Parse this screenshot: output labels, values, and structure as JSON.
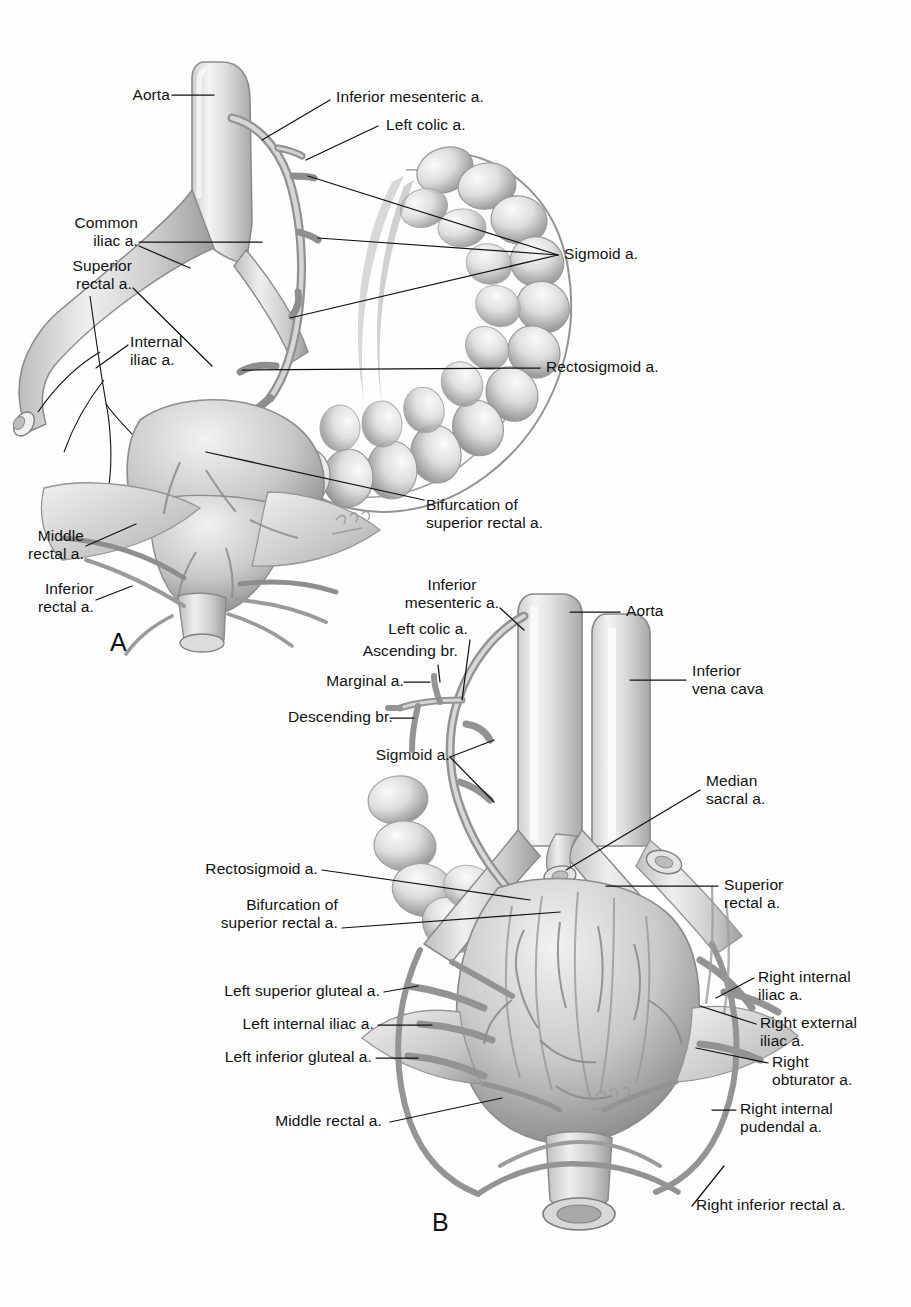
{
  "figure": {
    "type": "anatomical-illustration",
    "medium": "grayscale pencil / airbrush rendering",
    "background_color": "#ffffff",
    "ink_color": "#111111",
    "artwork_gray_light": "#e8e8e8",
    "artwork_gray_mid": "#b9b9b9",
    "artwork_gray_dark": "#6e6e6e",
    "artwork_outline": "#7a7a7a"
  },
  "panels": [
    {
      "id": "A",
      "letter": "A",
      "view": "left lateral view of sigmoid colon and rectum with arterial supply",
      "labels": [
        {
          "key": "aorta",
          "text": "Aorta"
        },
        {
          "key": "inferior_mesenteric",
          "text": "Inferior mesenteric a."
        },
        {
          "key": "left_colic",
          "text": "Left colic a."
        },
        {
          "key": "common_iliac",
          "text": "Common\niliac a."
        },
        {
          "key": "superior_rectal",
          "text": "Superior\nrectal a."
        },
        {
          "key": "internal_iliac",
          "text": "Internal\niliac a."
        },
        {
          "key": "sigmoid",
          "text": "Sigmoid a."
        },
        {
          "key": "rectosigmoid",
          "text": "Rectosigmoid a."
        },
        {
          "key": "bifurcation",
          "text": "Bifurcation of\nsuperior rectal a."
        },
        {
          "key": "middle_rectal",
          "text": "Middle\nrectal a."
        },
        {
          "key": "inferior_rectal",
          "text": "Inferior\nrectal a."
        }
      ]
    },
    {
      "id": "B",
      "letter": "B",
      "view": "anterior view of aorta, inferior vena cava, iliac vessels and rectum",
      "labels": [
        {
          "key": "inferior_mesenteric",
          "text": "Inferior\nmesenteric a."
        },
        {
          "key": "left_colic",
          "text": "Left colic a."
        },
        {
          "key": "ascending_br",
          "text": "Ascending br."
        },
        {
          "key": "marginal",
          "text": "Marginal a."
        },
        {
          "key": "descending_br",
          "text": "Descending br."
        },
        {
          "key": "sigmoid",
          "text": "Sigmoid a."
        },
        {
          "key": "aorta",
          "text": "Aorta"
        },
        {
          "key": "inferior_vena_cava",
          "text": "Inferior\nvena cava"
        },
        {
          "key": "median_sacral",
          "text": "Median\nsacral a."
        },
        {
          "key": "rectosigmoid",
          "text": "Rectosigmoid a."
        },
        {
          "key": "bifurcation",
          "text": "Bifurcation of\nsuperior rectal a."
        },
        {
          "key": "superior_rectal",
          "text": "Superior\nrectal a."
        },
        {
          "key": "left_superior_gluteal",
          "text": "Left superior gluteal a."
        },
        {
          "key": "left_internal_iliac",
          "text": "Left internal iliac a."
        },
        {
          "key": "left_inferior_gluteal",
          "text": "Left inferior gluteal a."
        },
        {
          "key": "right_internal_iliac",
          "text": "Right internal\niliac a."
        },
        {
          "key": "right_external_iliac",
          "text": "Right external\niliac a."
        },
        {
          "key": "right_obturator",
          "text": "Right\nobturator a."
        },
        {
          "key": "right_internal_pudendal",
          "text": "Right internal\npudendal a."
        },
        {
          "key": "middle_rectal",
          "text": "Middle rectal a."
        },
        {
          "key": "right_inferior_rectal",
          "text": "Right inferior rectal a."
        }
      ]
    }
  ]
}
